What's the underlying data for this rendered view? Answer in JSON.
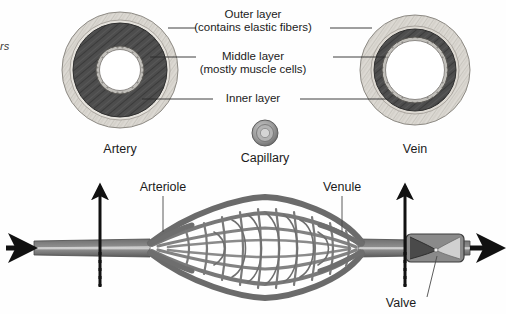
{
  "figure": {
    "title_visible": false,
    "background_color": "#fefefe",
    "width": 506,
    "height": 314
  },
  "edge_text": {
    "clipped_fragment": "rs"
  },
  "callouts": [
    {
      "id": "outer-layer",
      "line1": "Outer layer",
      "line2": "(contains elastic fibers)"
    },
    {
      "id": "middle-layer",
      "line1": "Middle layer",
      "line2": "(mostly muscle cells)"
    },
    {
      "id": "inner-layer",
      "line1": "Inner layer",
      "line2": ""
    }
  ],
  "cross_sections": [
    {
      "id": "artery",
      "label": "Artery"
    },
    {
      "id": "capillary",
      "label": "Capillary"
    },
    {
      "id": "vein",
      "label": "Vein"
    }
  ],
  "network_labels": [
    {
      "id": "arteriole",
      "label": "Arteriole"
    },
    {
      "id": "venule",
      "label": "Venule"
    },
    {
      "id": "valve",
      "label": "Valve"
    }
  ],
  "colors": {
    "outer_layer": "#d8d5cf",
    "middle_layer": "#4a4a4a",
    "inner_layer": "#b9b7b2",
    "lumen": "#ffffff",
    "vessel_gray": "#7d7d7d",
    "vessel_dark": "#4f4f4f",
    "arrow_black": "#111111",
    "leader_line": "#2b2b2b",
    "text": "#1b1b1b"
  }
}
